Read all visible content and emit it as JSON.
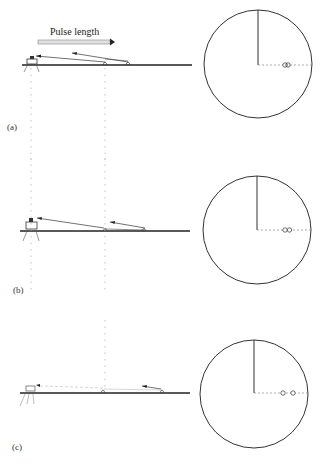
{
  "title_label": "Pulse length",
  "panels": [
    {
      "id": "a",
      "label": "(a)",
      "ground_y": 65,
      "instrument_x": 30,
      "target1_x": 105,
      "target2_x": 128,
      "scope": {
        "cx": 258,
        "cy": 64,
        "r": 54,
        "blips": [
          "oo (overlapping)"
        ]
      }
    },
    {
      "id": "b",
      "label": "(b)",
      "ground_y": 231,
      "instrument_x": 30,
      "target1_x": 105,
      "target2_x": 145,
      "scope": {
        "cx": 257,
        "cy": 230,
        "r": 54,
        "blips": [
          "oo (touching)"
        ]
      }
    },
    {
      "id": "c",
      "label": "(c)",
      "ground_y": 393,
      "instrument_x": 30,
      "target1_x": 103,
      "target2_x": 162,
      "scope": {
        "cx": 254,
        "cy": 394,
        "r": 54,
        "blips": [
          "o",
          "o (separated)"
        ]
      }
    }
  ],
  "colors": {
    "line": "#333333",
    "dotted": "#999999",
    "pulse_bar": "#cccccc"
  }
}
